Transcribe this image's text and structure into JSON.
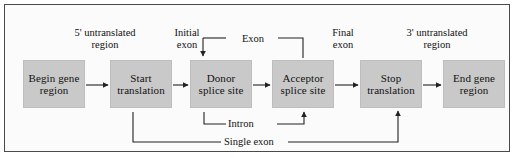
{
  "figure": {
    "kind": "flowchart-diagram",
    "frame_border_color": "#4a4a4a",
    "node_fill_color": "#c9c9c9",
    "line_color": "#222222",
    "background_color": "#ffffff"
  },
  "nodes": [
    {
      "id": "begin-gene-region",
      "label": "Begin\ngene\nregion"
    },
    {
      "id": "start-translation",
      "label": "Start\ntranslation"
    },
    {
      "id": "donor-splice-site",
      "label": "Donor\nsplice\nsite"
    },
    {
      "id": "acceptor-splice-site",
      "label": "Acceptor\nsplice\nsite"
    },
    {
      "id": "stop-translation",
      "label": "Stop\ntranslation"
    },
    {
      "id": "end-gene-region",
      "label": "End\ngene\nregion"
    }
  ],
  "top_labels": [
    {
      "id": "five-prime-untranslated-region",
      "label": "5' untranslated\nregion"
    },
    {
      "id": "initial-exon",
      "label": "Initial\nexon"
    },
    {
      "id": "exon",
      "label": "Exon"
    },
    {
      "id": "final-exon",
      "label": "Final\nexon"
    },
    {
      "id": "three-prime-untranslated-region",
      "label": "3' untranslated\nregion"
    }
  ],
  "bottom_labels": [
    {
      "id": "intron",
      "label": "Intron"
    },
    {
      "id": "single-exon",
      "label": "Single exon"
    }
  ],
  "edges": [
    {
      "from": "begin-gene-region",
      "to": "start-translation"
    },
    {
      "from": "start-translation",
      "to": "donor-splice-site"
    },
    {
      "from": "donor-splice-site",
      "to": "acceptor-splice-site"
    },
    {
      "from": "acceptor-splice-site",
      "to": "stop-translation"
    },
    {
      "from": "stop-translation",
      "to": "end-gene-region"
    },
    {
      "from": "start-translation",
      "to": "stop-translation",
      "via": "single-exon"
    },
    {
      "from": "donor-splice-site",
      "to": "acceptor-splice-site",
      "via": "intron"
    }
  ]
}
